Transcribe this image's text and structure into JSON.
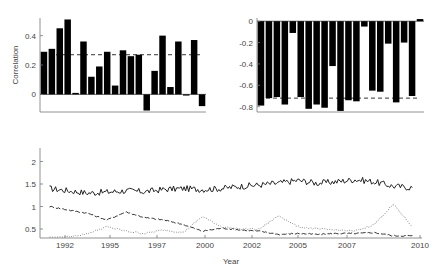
{
  "chart_data": [
    {
      "type": "bar",
      "title": "",
      "xlabel": "",
      "ylabel": "Correlation",
      "ylim": [
        -0.12,
        0.52
      ],
      "yticks": [
        "0",
        "0.2",
        "0.4"
      ],
      "values": [
        0.29,
        0.31,
        0.45,
        0.51,
        0.01,
        0.36,
        0.12,
        0.19,
        0.29,
        0.06,
        0.3,
        0.26,
        0.27,
        -0.11,
        0.16,
        0.4,
        0.05,
        0.36,
        0.0,
        0.37,
        -0.08
      ],
      "reference_line": {
        "style": "dashed",
        "value": 0.27
      }
    },
    {
      "type": "bar",
      "title": "",
      "xlabel": "",
      "ylabel": "",
      "ylim": [
        -0.85,
        0.03
      ],
      "yticks": [
        "0",
        "-0.2",
        "-0.4",
        "-0.6",
        "-0.8"
      ],
      "values": [
        -0.79,
        -0.72,
        -0.71,
        -0.78,
        -0.11,
        -0.71,
        -0.82,
        -0.78,
        -0.81,
        -0.42,
        -0.84,
        -0.74,
        -0.75,
        -0.05,
        -0.65,
        -0.66,
        -0.21,
        -0.76,
        -0.2,
        -0.7,
        0.02
      ],
      "reference_line": {
        "style": "dashed",
        "value": -0.72
      }
    },
    {
      "type": "line",
      "title": "",
      "xlabel": "Year",
      "ylabel": "",
      "ylim": [
        0.3,
        2.3
      ],
      "yticks": [
        "0.5",
        "1",
        "1.5",
        "2"
      ],
      "xticks": [
        "1992",
        "1995",
        "1997",
        "2000",
        "2002",
        "2005",
        "2007",
        "2010"
      ],
      "x": [
        1991,
        1992,
        1993,
        1994,
        1995,
        1996,
        1997,
        1998,
        1999,
        2000,
        2001,
        2002,
        2003,
        2004,
        2005,
        2006,
        2007,
        2008,
        2009,
        2010
      ],
      "series": [
        {
          "name": "solid",
          "style": "solid",
          "values": [
            1.4,
            1.35,
            1.3,
            1.32,
            1.35,
            1.33,
            1.38,
            1.4,
            1.38,
            1.4,
            1.45,
            1.48,
            1.52,
            1.58,
            1.52,
            1.55,
            1.6,
            1.55,
            1.45,
            1.42
          ]
        },
        {
          "name": "dashed",
          "style": "dashed",
          "values": [
            1.0,
            0.92,
            0.85,
            0.7,
            0.88,
            0.75,
            0.7,
            0.6,
            0.45,
            0.52,
            0.48,
            0.45,
            0.38,
            0.4,
            0.38,
            0.4,
            0.4,
            0.42,
            0.35,
            0.35
          ]
        },
        {
          "name": "dotted",
          "style": "dotted",
          "values": [
            0.3,
            0.32,
            0.4,
            0.55,
            0.45,
            0.4,
            0.48,
            0.42,
            0.78,
            0.55,
            0.5,
            0.5,
            0.8,
            0.55,
            0.5,
            0.48,
            0.45,
            0.6,
            1.05,
            0.55
          ]
        }
      ]
    }
  ]
}
